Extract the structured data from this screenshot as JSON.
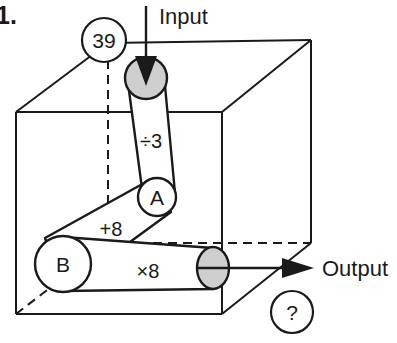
{
  "figure": {
    "item_number": "1.",
    "input_label": "Input",
    "output_label": "Output",
    "value_badge": "39",
    "unknown_badge": "?",
    "node_a": "A",
    "node_b": "B",
    "operations": {
      "divide": "÷3",
      "add": "+8",
      "multiply": "×8"
    },
    "colors": {
      "line": "#1a1a1a",
      "pulley_shade": "#cfcfcf",
      "background": "#ffffff"
    },
    "icons": {
      "input_arrow": "arrow-down-icon",
      "output_arrow": "arrow-right-icon"
    }
  }
}
